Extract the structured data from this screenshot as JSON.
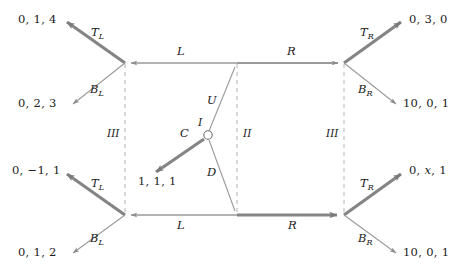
{
  "figure": {
    "type": "extensive-form game tree",
    "background_color": "#ffffff",
    "edge_color": "#8c8c8c",
    "bold_edge_color": "#7a7a7a",
    "dashed_color": "#b0b0b0",
    "text_color": "#1a1a1a",
    "width": 464,
    "height": 270
  },
  "payoffs": {
    "top_left_upper": "0, 1, 4",
    "top_left_lower": "0, 2, 3",
    "top_right_upper": "0, 3, 0",
    "top_right_lower": "10, 0, 1",
    "chance_left": "1, 1, 1",
    "bottom_left_upper": "0, −1, 1",
    "bottom_left_lower": "0, 1, 2",
    "bottom_right_upper_a": "0, ",
    "bottom_right_upper_x": "x",
    "bottom_right_upper_b": ", 1",
    "bottom_right_lower": "10, 0, 1"
  },
  "edge_labels": {
    "top_left_T": "T",
    "top_left_T_sub": "L",
    "top_left_B": "B",
    "top_left_B_sub": "L",
    "top_right_T": "T",
    "top_right_T_sub": "R",
    "top_right_B": "B",
    "top_right_B_sub": "R",
    "bottom_left_T": "T",
    "bottom_left_T_sub": "L",
    "bottom_left_B": "B",
    "bottom_left_B_sub": "L",
    "bottom_right_T": "T",
    "bottom_right_T_sub": "R",
    "bottom_right_B": "B",
    "bottom_right_B_sub": "R",
    "top_L": "L",
    "top_R": "R",
    "bottom_L": "L",
    "bottom_R": "R",
    "chance_C": "C",
    "chance_U": "U",
    "chance_D": "D"
  },
  "information_sets": {
    "left": "III",
    "middle": "II",
    "right": "III",
    "root": "I"
  }
}
